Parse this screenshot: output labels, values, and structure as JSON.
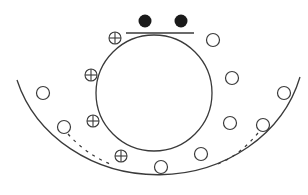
{
  "diagram": {
    "width": 308,
    "height": 195,
    "stroke_color": "#3a3a3a",
    "fill_color": "#1a1a1a",
    "inner_circle": {
      "cx": 154,
      "cy": 93,
      "r": 58
    },
    "tangent_line": {
      "x1": 126,
      "y1": 33,
      "x2": 194,
      "y2": 33
    },
    "filled_dots": [
      {
        "cx": 145,
        "cy": 21,
        "r": 6.5
      },
      {
        "cx": 181,
        "cy": 21,
        "r": 6.5
      }
    ],
    "outer_arc": {
      "start": [
        17,
        80
      ],
      "end": [
        300,
        77
      ],
      "rx": 147,
      "ry": 132
    },
    "plus_circles": [
      {
        "cx": 115,
        "cy": 38,
        "r": 6
      },
      {
        "cx": 91,
        "cy": 75,
        "r": 6
      },
      {
        "cx": 93,
        "cy": 121,
        "r": 6
      },
      {
        "cx": 121,
        "cy": 156,
        "r": 6
      }
    ],
    "open_circles": [
      {
        "cx": 213,
        "cy": 40,
        "r": 6.5
      },
      {
        "cx": 232,
        "cy": 78,
        "r": 6.5
      },
      {
        "cx": 43,
        "cy": 93,
        "r": 6.5
      },
      {
        "cx": 64,
        "cy": 127,
        "r": 6.5
      },
      {
        "cx": 230,
        "cy": 123,
        "r": 6.5
      },
      {
        "cx": 263,
        "cy": 125,
        "r": 6.5
      },
      {
        "cx": 201,
        "cy": 154,
        "r": 6.5
      },
      {
        "cx": 161,
        "cy": 167,
        "r": 6.5
      },
      {
        "cx": 284,
        "cy": 93,
        "r": 6.5
      }
    ],
    "dashed_arcs": [
      {
        "d": "M 68 134 Q 86 154 110 164"
      },
      {
        "d": "M 258 133 Q 240 155 218 164"
      }
    ]
  }
}
